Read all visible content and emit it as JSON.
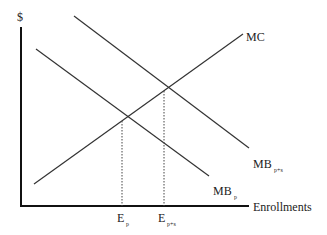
{
  "diagram": {
    "y_axis_label": "$",
    "x_axis_label": "Enrollments",
    "curves": [
      {
        "name": "MC",
        "label_main": "MC",
        "label_sub": "",
        "slope": "upward"
      },
      {
        "name": "MB_p+s",
        "label_main": "MB",
        "label_sub": "p+s",
        "slope": "downward"
      },
      {
        "name": "MB_p",
        "label_main": "MB",
        "label_sub": "p",
        "slope": "downward"
      }
    ],
    "equilibria": [
      {
        "name": "E_p",
        "label_main": "E",
        "label_sub": "p",
        "intersection": "MC x MB_p"
      },
      {
        "name": "E_p+s",
        "label_main": "E",
        "label_sub": "p+s",
        "intersection": "MC x MB_p+s"
      }
    ],
    "colors": {
      "lines": "#333333",
      "axes": "#111111",
      "dotted": "#444444"
    }
  }
}
